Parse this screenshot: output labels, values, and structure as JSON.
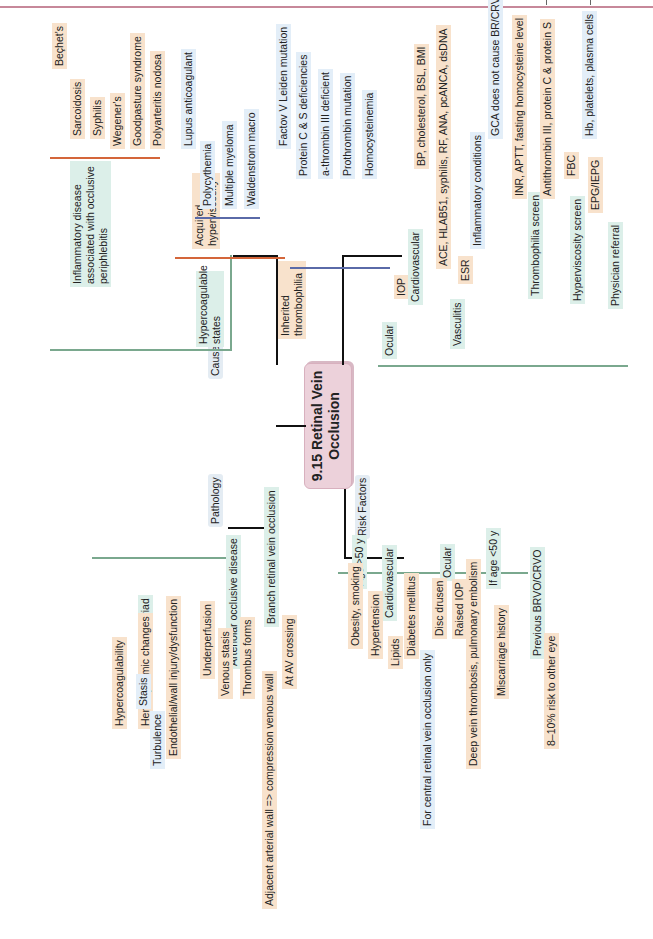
{
  "page": {
    "header_rule_color": "#c7889a"
  },
  "center": {
    "title": "9.15 Retinal Vein Occlusion"
  },
  "colors": {
    "level2": "#7aa88e",
    "level3": "#d4663a",
    "level4": "#5a6aa8",
    "center": "#ecd1da"
  },
  "causes": {
    "label": "Causes",
    "inflammatory": {
      "label": "Inflammatory disease associated with occlusive periphlebitis",
      "items": [
        "Beçhet's",
        "Sarcoidosis",
        "Syphilis",
        "Wegener's",
        "Goodpasture syndrome",
        "Polyarteritis nodosa"
      ]
    },
    "hypercoagulable": {
      "label": "Hypercoagulable states",
      "acquired": {
        "label": "Acquired hyperviscosity",
        "items": [
          "Lupus anticoagulant",
          "Polycythemia",
          "Multiple myeloma",
          "Waldenstrom macro"
        ]
      },
      "inherited": {
        "label": "Inherited thrombophilia",
        "items": [
          "Factov V Leiden mutation",
          "Protein C & S deficiencies",
          "a-thrombin III deficient",
          "Prothrombin mutation",
          "Homocysteinemia"
        ]
      }
    }
  },
  "workup": {
    "items": [
      {
        "label": "Ocular",
        "sub": "IOP"
      },
      {
        "label": "Cardiovascular",
        "sub": "BP, cholesterol, BSL, BMI"
      },
      {
        "label": "Vasculitis",
        "sub": "ACE, HLAB51, syphilis, RF, ANA, pcANCA, dsDNA",
        "esr": "ESR",
        "esr_sub": "Inflammatory conditions",
        "esr_sub2": "GCA does not cause BR/CRVO"
      },
      {
        "label": "Thrombophilia screen",
        "subs": [
          "INR, APTT, fasting homocysteine level",
          "Antithrombin III, protein C & protein S"
        ]
      },
      {
        "label": "Hyperviscosity screen",
        "fbc": "FBC",
        "fbc_sub": "Hb, platelets, plasma cells",
        "epg": "EPG/IEPG"
      },
      {
        "label": "Physician referral"
      }
    ]
  },
  "pathology": {
    "label": "Pathology",
    "virchow": {
      "label": "Virchow's triad",
      "items": [
        "Hypercoagulability",
        "Hemodynamic changes",
        "Endothelial/wall injury/dysfunction"
      ],
      "hemo_subs": [
        "Stasis",
        "Turbulence"
      ]
    },
    "arteriolar": {
      "label": "Arteriolar occlusive disease",
      "items": [
        "Underperfusion",
        "Venous stasis",
        "Thrombus forms"
      ]
    },
    "branch": {
      "label": "Branch retinal vein occlusion",
      "items": [
        "Adjacent arterial wall => compression venous wall",
        "At AV crossing"
      ]
    }
  },
  "risk": {
    "label": "Risk Factors",
    "age50": "Age >50 y",
    "cardio": {
      "label": "Cardiovascular",
      "items": [
        "Obesity, smoking",
        "Hypertension",
        "Lipids",
        "Diabetes mellitus"
      ],
      "dm_sub": "For central retinal vein occlusion only"
    },
    "ocular": {
      "label": "Ocular",
      "items": [
        "Disc drusen",
        "Raised IOP"
      ]
    },
    "age_lt50": {
      "label": "If age <50 y",
      "items": [
        "Deep vein thrombosis, pulmonary embolism",
        "Miscarriage history"
      ]
    },
    "previous": {
      "label": "Previous BRVO/CRVO",
      "items": [
        "8–10% risk to other eye"
      ]
    }
  }
}
